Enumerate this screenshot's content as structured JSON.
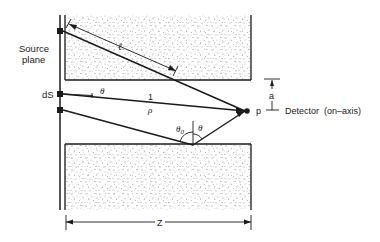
{
  "diagram": {
    "labels": {
      "source_plane_line1": "Source",
      "source_plane_line2": "plane",
      "ds": "dS",
      "ell": "ℓ",
      "theta_upper": "θ",
      "one": "1",
      "rho": "ρ",
      "theta0": "θ",
      "theta0_sub": "0",
      "theta_lower": "θ",
      "p": "p",
      "a": "a",
      "detector": "Detector  (on–axis)",
      "z": "Z"
    },
    "colors": {
      "ink": "#1a1a1a",
      "stipple": "#6e6e6e",
      "background": "#ffffff"
    }
  }
}
